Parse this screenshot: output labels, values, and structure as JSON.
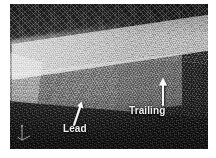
{
  "figure": {
    "kind": "computational-mesh-visualization",
    "background_color": "#ffffff",
    "plate_background_color": "#101010"
  },
  "annotations": [
    {
      "id": "lead",
      "label": "Lead",
      "arrow_icon": "arrow-up-right-icon",
      "arrow_direction": "up-right",
      "color": "#f2f2f2"
    },
    {
      "id": "trailing",
      "label": "Trailing",
      "arrow_icon": "arrow-up-icon",
      "arrow_direction": "up",
      "color": "#f2f2f2"
    }
  ],
  "axis_triad": {
    "icon": "coordinate-axes-icon",
    "color": "#d8d8d8"
  },
  "regions": {
    "far_field_mesh": "coarse unstructured triangular mesh",
    "refined_block": "bright refined mesh box",
    "wake": "dark downstream region",
    "floor": "dark foreground mesh"
  }
}
